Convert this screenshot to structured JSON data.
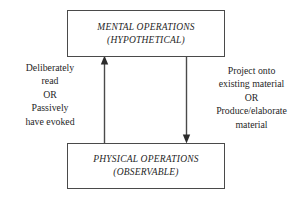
{
  "diagram": {
    "background_color": "#ffffff",
    "line_color": "#4a4a4a",
    "text_color": "#1f1f1f",
    "nodes": [
      {
        "id": "mental-operations",
        "line1": "MENTAL OPERATIONS",
        "line2": "(HYPOTHETICAL)"
      },
      {
        "id": "physical-operations",
        "line1": "PHYSICAL OPERATIONS",
        "line2": "(OBSERVABLE)"
      }
    ],
    "edges": [
      {
        "id": "upward-edge",
        "direction": "up",
        "from": "physical-operations",
        "to": "mental-operations",
        "label": {
          "line1": "Deliberately",
          "line2": "read",
          "line3": "OR",
          "line4": "Passively",
          "line5": "have evoked"
        }
      },
      {
        "id": "downward-edge",
        "direction": "down",
        "from": "mental-operations",
        "to": "physical-operations",
        "label": {
          "line1": "Project onto",
          "line2": "existing material",
          "line3": "OR",
          "line4": "Produce/elaborate",
          "line5": "material"
        }
      }
    ]
  }
}
